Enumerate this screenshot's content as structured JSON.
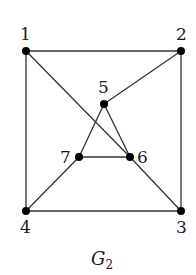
{
  "title": {
    "main": "G",
    "subscript": "2"
  },
  "nodes": [
    {
      "id": "1",
      "x": 26,
      "y": 51,
      "lx": 20,
      "ly": 40
    },
    {
      "id": "2",
      "x": 181,
      "y": 51,
      "lx": 176,
      "ly": 40
    },
    {
      "id": "3",
      "x": 181,
      "y": 211,
      "lx": 176,
      "ly": 233
    },
    {
      "id": "4",
      "x": 26,
      "y": 211,
      "lx": 20,
      "ly": 233
    },
    {
      "id": "5",
      "x": 104,
      "y": 104,
      "lx": 98,
      "ly": 93
    },
    {
      "id": "6",
      "x": 130,
      "y": 157,
      "lx": 137,
      "ly": 163
    },
    {
      "id": "7",
      "x": 79,
      "y": 157,
      "lx": 60,
      "ly": 163
    }
  ],
  "edges": [
    [
      "1",
      "2"
    ],
    [
      "1",
      "4"
    ],
    [
      "2",
      "3"
    ],
    [
      "4",
      "3"
    ],
    [
      "1",
      "6"
    ],
    [
      "6",
      "3"
    ],
    [
      "2",
      "5"
    ],
    [
      "5",
      "7"
    ],
    [
      "5",
      "6"
    ],
    [
      "7",
      "6"
    ],
    [
      "7",
      "4"
    ]
  ],
  "colors": {
    "edge": "#333333",
    "node": "#000000",
    "background": "#ffffff"
  }
}
